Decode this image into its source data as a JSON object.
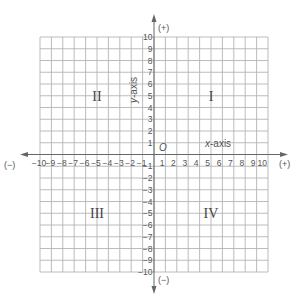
{
  "diagram": {
    "range": {
      "xmin": -10,
      "xmax": 10,
      "ymin": -10,
      "ymax": 10
    },
    "grid": {
      "left": 40,
      "right": 268,
      "top": 37,
      "bottom": 272,
      "origin_x": 154,
      "origin_y": 154.5
    },
    "axes": {
      "x": {
        "label_var": "x",
        "label_rest": "-axis",
        "positive_sign": "(+)",
        "negative_sign": "(−)",
        "arrow_left_x": 20,
        "arrow_right_x": 288
      },
      "y": {
        "label_var": "y",
        "label_rest": "-axis",
        "positive_sign": "(+)",
        "negative_sign": "(−)",
        "arrow_top_y": 14,
        "arrow_bottom_y": 294
      }
    },
    "origin_label": "O",
    "x_ticks": [
      "−10",
      "−9",
      "−8",
      "−7",
      "−6",
      "−5",
      "−4",
      "−3",
      "−2",
      "−1",
      "1",
      "2",
      "3",
      "4",
      "5",
      "6",
      "7",
      "8",
      "9",
      "10"
    ],
    "y_ticks": [
      "10",
      "9",
      "8",
      "7",
      "6",
      "5",
      "4",
      "3",
      "2",
      "1",
      "−1",
      "−2",
      "−3",
      "−4",
      "−5",
      "−6",
      "−7",
      "−8",
      "−9",
      "−10"
    ],
    "quadrants": [
      {
        "id": "I",
        "label": "I",
        "x": 5,
        "y": 5
      },
      {
        "id": "II",
        "label": "II",
        "x": -5,
        "y": 5
      },
      {
        "id": "III",
        "label": "III",
        "x": -5,
        "y": -5
      },
      {
        "id": "IV",
        "label": "IV",
        "x": 5,
        "y": -5
      }
    ],
    "colors": {
      "grid": "#b4b4b4",
      "axis": "#666666",
      "text": "#555555",
      "background": "#ffffff"
    }
  }
}
